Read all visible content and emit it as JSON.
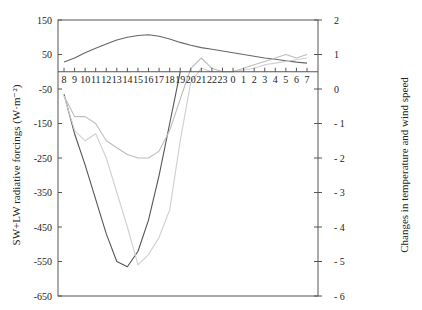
{
  "chart_data": {
    "type": "line",
    "title": "",
    "xlabel": "",
    "ylabel_left": "SW+LW radiative forcings (W·m⁻²)",
    "ylabel_right": "Changes in temperature and wind speed",
    "x": [
      "8",
      "9",
      "10",
      "11",
      "12",
      "13",
      "14",
      "15",
      "16",
      "17",
      "18",
      "19",
      "20",
      "21",
      "22",
      "23",
      "0",
      "1",
      "2",
      "3",
      "4",
      "5",
      "6",
      "7"
    ],
    "ylim_left": [
      -650,
      150
    ],
    "yticks_left": [
      150,
      50,
      -50,
      -150,
      -250,
      -350,
      -450,
      -550,
      -650
    ],
    "ylim_right": [
      -6,
      2
    ],
    "yticks_right": [
      2,
      1,
      0,
      -1,
      -2,
      -3,
      -4,
      -5,
      -6
    ],
    "ytick_labels_right": [
      "2",
      "1",
      "0",
      "- 1",
      "- 2",
      "- 3",
      "- 4",
      "- 5",
      "- 6"
    ],
    "grid": false,
    "legend": null,
    "series": [
      {
        "name": "SW+LW forcing (daytime)",
        "axis": "left",
        "color": "#555555",
        "values": [
          -65,
          -180,
          -270,
          -370,
          -470,
          -550,
          -565,
          -520,
          -430,
          -300,
          -150,
          0,
          null,
          null,
          null,
          null,
          null,
          null,
          null,
          null,
          null,
          null,
          null,
          null
        ]
      },
      {
        "name": "Upper forcing curve",
        "axis": "left",
        "color": "#666666",
        "values": [
          28,
          40,
          55,
          68,
          80,
          92,
          100,
          105,
          107,
          103,
          95,
          85,
          77,
          70,
          65,
          60,
          55,
          50,
          45,
          40,
          36,
          32,
          28,
          25
        ]
      },
      {
        "name": "Change A (light)",
        "axis": "right",
        "color": "#bdbdbd",
        "values": [
          -0.2,
          -0.8,
          -0.8,
          -1.0,
          -1.5,
          -1.7,
          -1.9,
          -2.0,
          -2.0,
          -1.8,
          -1.2,
          -0.3,
          0.6,
          0.9,
          0.6,
          0.5,
          0.5,
          0.6,
          0.7,
          0.8,
          0.9,
          1.0,
          0.9,
          1.0
        ]
      },
      {
        "name": "Change B (light)",
        "axis": "right",
        "color": "#cfcfcf",
        "values": [
          -0.2,
          -1.2,
          -1.5,
          -1.3,
          -2.0,
          -3.0,
          -4.0,
          -5.1,
          -4.8,
          -4.3,
          -3.5,
          -1.5,
          0.2,
          0.6,
          0.5,
          0.5,
          0.5,
          0.55,
          0.6,
          0.7,
          0.75,
          0.8,
          0.85,
          0.9
        ]
      }
    ]
  }
}
